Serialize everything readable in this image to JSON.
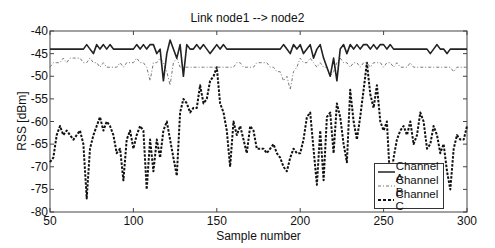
{
  "chart_data": {
    "type": "line",
    "title": "Link node1 --> node2",
    "xlabel": "Sample number",
    "ylabel": "RSS [dBm]",
    "xlim": [
      50,
      300
    ],
    "ylim": [
      -80,
      -40
    ],
    "xticks": [
      50,
      100,
      150,
      200,
      250,
      300
    ],
    "yticks": [
      -80,
      -75,
      -70,
      -65,
      -60,
      -55,
      -50,
      -45,
      -40
    ],
    "grid": false,
    "legend_position": "lower right",
    "x": [
      50,
      52,
      54,
      56,
      58,
      60,
      62,
      64,
      66,
      68,
      70,
      72,
      74,
      76,
      78,
      80,
      82,
      84,
      86,
      88,
      90,
      92,
      94,
      96,
      98,
      100,
      102,
      104,
      106,
      108,
      110,
      112,
      114,
      116,
      118,
      120,
      122,
      124,
      126,
      128,
      130,
      132,
      134,
      136,
      138,
      140,
      142,
      144,
      146,
      148,
      150,
      152,
      154,
      156,
      158,
      160,
      162,
      164,
      166,
      168,
      170,
      172,
      174,
      176,
      178,
      180,
      182,
      184,
      186,
      188,
      190,
      192,
      194,
      196,
      198,
      200,
      202,
      204,
      206,
      208,
      210,
      212,
      214,
      216,
      218,
      220,
      222,
      224,
      226,
      228,
      230,
      232,
      234,
      236,
      238,
      240,
      242,
      244,
      246,
      248,
      250,
      252,
      254,
      256,
      258,
      260,
      262,
      264,
      266,
      268,
      270,
      272,
      274,
      276,
      278,
      280,
      282,
      284,
      286,
      288,
      290,
      292,
      294,
      296,
      298,
      300
    ],
    "series": [
      {
        "name": "Channel A",
        "style": "solid",
        "values": [
          -44,
          -44,
          -44,
          -44,
          -44,
          -44,
          -44,
          -44,
          -44,
          -44,
          -44,
          -43,
          -44,
          -45,
          -43,
          -44,
          -43,
          -44,
          -43,
          -44,
          -44,
          -44,
          -44,
          -44,
          -44,
          -44,
          -43,
          -44,
          -43,
          -44,
          -43,
          -43,
          -45,
          -44,
          -51,
          -45,
          -42,
          -44,
          -46,
          -43,
          -50,
          -43,
          -44,
          -44,
          -43,
          -44,
          -43,
          -44,
          -45,
          -44,
          -43,
          -44,
          -43,
          -44,
          -44,
          -44,
          -44,
          -44,
          -44,
          -44,
          -44,
          -44,
          -44,
          -44,
          -44,
          -44,
          -44,
          -44,
          -44,
          -44,
          -43,
          -44,
          -45,
          -43,
          -44,
          -43,
          -45,
          -44,
          -43,
          -46,
          -44,
          -43,
          -46,
          -48,
          -50,
          -46,
          -51,
          -44,
          -43,
          -45,
          -43,
          -44,
          -43,
          -44,
          -43,
          -43,
          -44,
          -43,
          -44,
          -43,
          -43,
          -44,
          -43,
          -44,
          -44,
          -44,
          -44,
          -44,
          -44,
          -44,
          -44,
          -44,
          -44,
          -44,
          -45,
          -44,
          -43,
          -44,
          -44,
          -45,
          -44,
          -44,
          -44,
          -44,
          -44,
          -44
        ]
      },
      {
        "name": "Channel B",
        "style": "dash-dot",
        "values": [
          -48,
          -47,
          -47,
          -47,
          -46,
          -47,
          -46,
          -46,
          -46,
          -46,
          -47,
          -47,
          -46,
          -47,
          -47,
          -48,
          -47,
          -48,
          -48,
          -48,
          -48,
          -47,
          -48,
          -47,
          -47,
          -47,
          -46,
          -47,
          -47,
          -48,
          -51,
          -47,
          -47,
          -46,
          -47,
          -49,
          -52,
          -47,
          -46,
          -48,
          -48,
          -48,
          -48,
          -48,
          -48,
          -48,
          -48,
          -48,
          -48,
          -48,
          -48,
          -48,
          -48,
          -48,
          -48,
          -48,
          -47,
          -47,
          -48,
          -48,
          -48,
          -48,
          -47,
          -47,
          -47,
          -47,
          -48,
          -48,
          -49,
          -49,
          -51,
          -50,
          -53,
          -49,
          -48,
          -46,
          -47,
          -47,
          -46,
          -47,
          -48,
          -47,
          -48,
          -48,
          -50,
          -49,
          -47,
          -46,
          -47,
          -47,
          -48,
          -47,
          -47,
          -48,
          -47,
          -47,
          -48,
          -47,
          -47,
          -47,
          -48,
          -47,
          -47,
          -48,
          -47,
          -48,
          -48,
          -48,
          -47,
          -48,
          -48,
          -48,
          -48,
          -48,
          -48,
          -48,
          -48,
          -48,
          -48,
          -48,
          -48,
          -49,
          -48,
          -48,
          -48,
          -48
        ]
      },
      {
        "name": "Channel C",
        "style": "dashed",
        "values": [
          -69,
          -68,
          -63,
          -61,
          -63,
          -62,
          -63,
          -64,
          -63,
          -62,
          -65,
          -77,
          -66,
          -63,
          -61,
          -59,
          -62,
          -60,
          -61,
          -63,
          -67,
          -66,
          -73,
          -64,
          -62,
          -66,
          -63,
          -61,
          -62,
          -75,
          -64,
          -71,
          -64,
          -68,
          -62,
          -60,
          -64,
          -68,
          -72,
          -58,
          -55,
          -56,
          -58,
          -57,
          -57,
          -52,
          -56,
          -55,
          -51,
          -50,
          -48,
          -56,
          -58,
          -62,
          -70,
          -60,
          -63,
          -61,
          -64,
          -67,
          -61,
          -62,
          -66,
          -66,
          -66,
          -67,
          -66,
          -65,
          -67,
          -68,
          -70,
          -71,
          -68,
          -66,
          -67,
          -67,
          -64,
          -59,
          -58,
          -66,
          -74,
          -62,
          -73,
          -59,
          -58,
          -67,
          -56,
          -59,
          -65,
          -69,
          -53,
          -60,
          -64,
          -59,
          -53,
          -47,
          -54,
          -57,
          -52,
          -60,
          -62,
          -60,
          -74,
          -68,
          -64,
          -62,
          -61,
          -63,
          -60,
          -65,
          -63,
          -58,
          -60,
          -66,
          -65,
          -61,
          -63,
          -67,
          -65,
          -71,
          -75,
          -66,
          -63,
          -64,
          -64,
          -61
        ]
      }
    ]
  },
  "legend": {
    "items": [
      {
        "label": "Channel A"
      },
      {
        "label": "Channel B"
      },
      {
        "label": "Channel C"
      }
    ]
  }
}
